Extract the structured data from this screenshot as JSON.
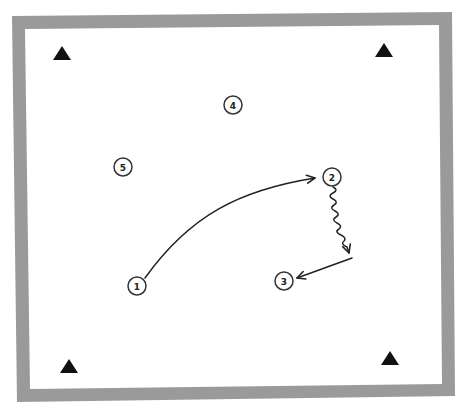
{
  "diagram": {
    "type": "drill-diagram",
    "field": {
      "border_color": "#9a9a9a",
      "background": "#ffffff"
    },
    "cones": [
      {
        "id": "cone-top-left",
        "x": 62,
        "y": 53
      },
      {
        "id": "cone-top-right",
        "x": 384,
        "y": 50
      },
      {
        "id": "cone-bottom-left",
        "x": 69,
        "y": 366
      },
      {
        "id": "cone-bottom-right",
        "x": 390,
        "y": 358
      }
    ],
    "players": [
      {
        "label": "1",
        "x": 137,
        "y": 286
      },
      {
        "label": "2",
        "x": 332,
        "y": 177
      },
      {
        "label": "3",
        "x": 284,
        "y": 281
      },
      {
        "label": "4",
        "x": 233,
        "y": 105
      },
      {
        "label": "5",
        "x": 123,
        "y": 167
      }
    ],
    "movements": [
      {
        "type": "pass",
        "from": "1",
        "to": "2",
        "style": "curved-arrow"
      },
      {
        "type": "dribble",
        "from": "2",
        "style": "wavy-arrow"
      },
      {
        "type": "pass",
        "to": "3",
        "style": "straight-arrow"
      }
    ],
    "colors": {
      "ink": "#222222",
      "border": "#9a9a9a"
    }
  }
}
